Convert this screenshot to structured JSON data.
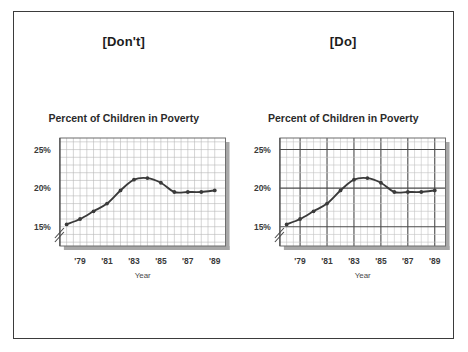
{
  "figure": {
    "border_color": "#3b3b3b",
    "background": "#ffffff"
  },
  "panels": [
    {
      "tag": "[Don't]",
      "name": "dont",
      "grid_emphasis": false,
      "grid_minor_color": "#b9b9b9",
      "grid_major_color": "#b9b9b9",
      "chart_data": {
        "type": "line",
        "title": "Percent of Children in Poverty",
        "xlabel": "Year",
        "ylabel": "",
        "x": [
          1978,
          1979,
          1980,
          1981,
          1982,
          1983,
          1984,
          1985,
          1986,
          1987,
          1988,
          1989
        ],
        "values": [
          15.3,
          16.0,
          17.0,
          18.0,
          19.7,
          21.1,
          21.3,
          20.7,
          19.5,
          19.5,
          19.5,
          19.7
        ],
        "xtick_labels": [
          "'79",
          "'81",
          "'83",
          "'85",
          "'87",
          "'89"
        ],
        "xtick_values": [
          1979,
          1981,
          1983,
          1985,
          1987,
          1989
        ],
        "ytick_labels": [
          "15%",
          "20%",
          "25%"
        ],
        "ytick_values": [
          15,
          20,
          25
        ],
        "ylim": [
          12.5,
          26.5
        ],
        "xlim": [
          1977.5,
          1989.8
        ],
        "grid": true,
        "axis_break": true,
        "legend": "none",
        "line_color": "#3a3a3a",
        "marker": "dot"
      }
    },
    {
      "tag": "[Do]",
      "name": "do",
      "grid_emphasis": true,
      "grid_minor_color": "#c2c2c2",
      "grid_major_color": "#4a4a4a",
      "chart_data": {
        "type": "line",
        "title": "Percent of Children in Poverty",
        "xlabel": "Year",
        "ylabel": "",
        "x": [
          1978,
          1979,
          1980,
          1981,
          1982,
          1983,
          1984,
          1985,
          1986,
          1987,
          1988,
          1989
        ],
        "values": [
          15.3,
          16.0,
          17.0,
          18.0,
          19.7,
          21.1,
          21.3,
          20.7,
          19.5,
          19.5,
          19.5,
          19.7
        ],
        "xtick_labels": [
          "'79",
          "'81",
          "'83",
          "'85",
          "'87",
          "'89"
        ],
        "xtick_values": [
          1979,
          1981,
          1983,
          1985,
          1987,
          1989
        ],
        "ytick_labels": [
          "15%",
          "20%",
          "25%"
        ],
        "ytick_values": [
          15,
          20,
          25
        ],
        "ylim": [
          12.5,
          26.5
        ],
        "xlim": [
          1977.5,
          1989.8
        ],
        "grid": true,
        "axis_break": true,
        "legend": "none",
        "line_color": "#3a3a3a",
        "marker": "dot"
      }
    }
  ]
}
